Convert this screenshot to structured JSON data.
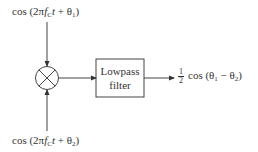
{
  "diagram": {
    "type": "block-diagram",
    "input_top": {
      "label": "cos (2πf_C t + θ_1)",
      "prefix": "cos (2π",
      "f": "f",
      "f_sub": "C",
      "t": "t",
      "plus": " + θ",
      "theta_sub": "1",
      "close": ")"
    },
    "input_bottom": {
      "label": "cos (2πf_C t + θ_2)",
      "prefix": "cos (2π",
      "f": "f",
      "f_sub": "C",
      "t": "t",
      "plus": " + θ",
      "theta_sub": "2",
      "close": ")"
    },
    "multiplier": {
      "symbol": "×",
      "icon": "multiplier-circle-icon"
    },
    "filter": {
      "line1": "Lowpass",
      "line2": "filter"
    },
    "output": {
      "label": "1/2 cos (θ_1 − θ_2)",
      "frac_num": "1",
      "frac_den": "2",
      "prefix": "cos (θ",
      "sub1": "1",
      "minus": " − θ",
      "sub2": "2",
      "close": ")"
    },
    "colors": {
      "stroke": "#444444",
      "text": "#333333",
      "background": "#ffffff"
    }
  }
}
